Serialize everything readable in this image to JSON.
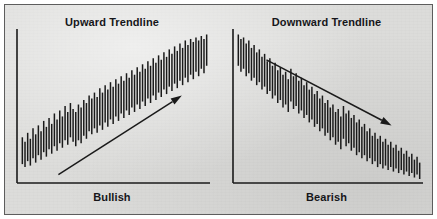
{
  "figure": {
    "background_color": "#dcdcda",
    "ink_color": "#1a1a1a",
    "border_color": "#5d5d5d",
    "width": 437,
    "height": 219
  },
  "panels": [
    {
      "id": "bullish",
      "title": "Upward Trendline",
      "caption": "Bullish",
      "trend_direction": "up",
      "arrow_label": "upward-trend-arrow"
    },
    {
      "id": "bearish",
      "title": "Downward Trendline",
      "caption": "Bearish",
      "trend_direction": "down",
      "arrow_label": "downward-trend-arrow"
    }
  ],
  "chart_data": [
    {
      "type": "bar",
      "id": "bullish",
      "title": "Upward Trendline",
      "xlabel": "Bullish",
      "ylabel": "",
      "grid": false,
      "legend": null,
      "axes": {
        "x_axis": true,
        "y_axis": true,
        "ticks": false,
        "tick_labels": []
      },
      "series_name": "price-range-bars",
      "note": "Each value pair is the low and high of one vertical OHLC range bar, in chart units 0-100 bottom to top, left to right.",
      "bars_low": [
        12,
        10,
        14,
        11,
        16,
        13,
        18,
        15,
        20,
        17,
        22,
        19,
        24,
        21,
        26,
        23,
        28,
        25,
        30,
        27,
        24,
        28,
        26,
        31,
        29,
        34,
        32,
        36,
        33,
        38,
        35,
        40,
        37,
        42,
        39,
        44,
        41,
        46,
        43,
        48,
        45,
        50,
        47,
        52,
        49,
        54,
        51,
        56,
        53,
        58,
        55,
        60,
        57,
        62,
        59,
        64,
        61,
        66,
        63,
        68,
        65,
        70,
        67,
        72,
        69,
        74,
        71,
        76,
        73,
        78
      ],
      "bars_high": [
        30,
        27,
        33,
        29,
        36,
        32,
        38,
        34,
        41,
        37,
        43,
        39,
        46,
        42,
        48,
        44,
        51,
        47,
        53,
        49,
        47,
        52,
        50,
        55,
        53,
        58,
        56,
        60,
        57,
        63,
        60,
        65,
        62,
        67,
        64,
        69,
        66,
        71,
        68,
        73,
        70,
        75,
        72,
        77,
        74,
        79,
        76,
        81,
        78,
        83,
        80,
        85,
        82,
        87,
        84,
        89,
        86,
        91,
        88,
        93,
        90,
        95,
        92,
        96,
        94,
        97,
        95,
        98,
        96,
        99
      ],
      "trendline": {
        "label": "Upward Trendline",
        "style": "arrow",
        "from": {
          "x": 0.2,
          "y": 0.05
        },
        "to": {
          "x": 0.86,
          "y": 0.58
        },
        "direction": "up"
      }
    },
    {
      "type": "bar",
      "id": "bearish",
      "title": "Downward Trendline",
      "xlabel": "Bearish",
      "ylabel": "",
      "grid": false,
      "legend": null,
      "axes": {
        "x_axis": true,
        "y_axis": true,
        "ticks": false,
        "tick_labels": []
      },
      "series_name": "price-range-bars",
      "note": "Each value pair is the low and high of one vertical OHLC range bar, in chart units 0-100 bottom to top, left to right.",
      "bars_low": [
        78,
        74,
        76,
        71,
        73,
        68,
        70,
        65,
        67,
        62,
        64,
        59,
        61,
        56,
        58,
        53,
        55,
        50,
        52,
        47,
        54,
        49,
        51,
        46,
        48,
        43,
        45,
        40,
        42,
        37,
        39,
        34,
        36,
        31,
        33,
        28,
        30,
        25,
        27,
        22,
        29,
        24,
        26,
        21,
        23,
        18,
        20,
        16,
        18,
        14,
        16,
        12,
        14,
        10,
        12,
        9,
        11,
        8,
        10,
        7,
        9,
        6,
        8,
        5,
        7,
        4,
        6,
        3,
        5,
        2
      ],
      "bars_high": [
        99,
        96,
        97,
        93,
        95,
        90,
        92,
        87,
        89,
        84,
        86,
        81,
        83,
        78,
        80,
        75,
        77,
        72,
        74,
        69,
        76,
        71,
        73,
        68,
        70,
        65,
        67,
        62,
        64,
        59,
        61,
        56,
        58,
        53,
        55,
        50,
        52,
        47,
        49,
        44,
        51,
        46,
        48,
        43,
        45,
        40,
        42,
        37,
        39,
        34,
        36,
        31,
        33,
        29,
        31,
        27,
        29,
        25,
        27,
        23,
        25,
        21,
        23,
        19,
        21,
        17,
        19,
        15,
        17,
        13
      ],
      "trendline": {
        "label": "Downward Trendline",
        "style": "arrow",
        "from": {
          "x": 0.16,
          "y": 0.82
        },
        "to": {
          "x": 0.84,
          "y": 0.38
        },
        "direction": "down"
      }
    }
  ]
}
